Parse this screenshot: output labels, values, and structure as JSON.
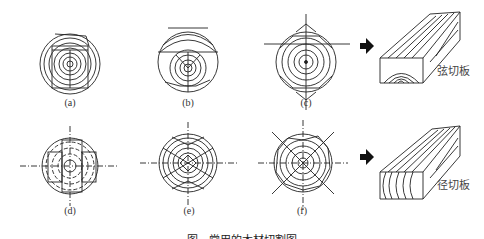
{
  "figure": {
    "panels": [
      {
        "id": "a",
        "label": "(a)",
        "cx": 70,
        "cy": 64
      },
      {
        "id": "b",
        "label": "(b)",
        "cx": 188,
        "cy": 62
      },
      {
        "id": "c",
        "label": "(c)",
        "cx": 306,
        "cy": 62
      },
      {
        "id": "d",
        "label": "(d)",
        "cx": 70,
        "cy": 166
      },
      {
        "id": "e",
        "label": "(e)",
        "cx": 188,
        "cy": 163
      },
      {
        "id": "f",
        "label": "(f)",
        "cx": 303,
        "cy": 163
      }
    ],
    "boards": [
      {
        "id": "flat-sawn",
        "label": "弦切板"
      },
      {
        "id": "quarter-sawn",
        "label": "径切板"
      }
    ],
    "caption": "图  ·  常用的木材切割图"
  }
}
